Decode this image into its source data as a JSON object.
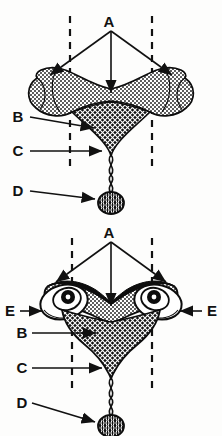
{
  "figure": {
    "background_color": "#fdfdfc",
    "ink_color": "#0d0d0d",
    "panels": [
      {
        "id": "top",
        "name": "upper-diagram",
        "caption": "",
        "labels": [
          {
            "key": "A",
            "text": "A",
            "x": 109,
            "y": 22,
            "arrow_count": 3,
            "position": "top-center"
          },
          {
            "key": "B",
            "text": "B",
            "x": 18,
            "y": 121,
            "arrow_count": 1,
            "position": "left"
          },
          {
            "key": "C",
            "text": "C",
            "x": 18,
            "y": 154,
            "arrow_count": 1,
            "position": "left"
          },
          {
            "key": "D",
            "text": "D",
            "x": 18,
            "y": 190,
            "arrow_count": 1,
            "position": "left"
          }
        ],
        "guides": [
          {
            "name": "left-dashed-guide",
            "x": 70,
            "y1": 16,
            "y2": 170
          },
          {
            "name": "right-dashed-guide",
            "x": 152,
            "y1": 16,
            "y2": 170
          }
        ],
        "parts": [
          {
            "name": "stippled-band",
            "texture": "stipple",
            "fill": "#ffffff"
          },
          {
            "name": "crosshatch-wedge",
            "texture": "crosshatch",
            "fill": "#1a1a1a"
          },
          {
            "name": "twisted-cord",
            "texture": "twist"
          },
          {
            "name": "oval-body",
            "texture": "mottled"
          }
        ]
      },
      {
        "id": "bottom",
        "name": "lower-diagram",
        "caption": "",
        "labels": [
          {
            "key": "A",
            "text": "A",
            "x": 109,
            "y": 232,
            "arrow_count": 3,
            "position": "top-center"
          },
          {
            "key": "E-left",
            "text": "E",
            "x": 10,
            "y": 312,
            "arrow_count": 1,
            "position": "left"
          },
          {
            "key": "E-right",
            "text": "E",
            "x": 206,
            "y": 312,
            "arrow_count": 1,
            "position": "right"
          },
          {
            "key": "B",
            "text": "B",
            "x": 22,
            "y": 334,
            "arrow_count": 1,
            "position": "left"
          },
          {
            "key": "C",
            "text": "C",
            "x": 22,
            "y": 368,
            "arrow_count": 1,
            "position": "left"
          },
          {
            "key": "D",
            "text": "D",
            "x": 22,
            "y": 403,
            "arrow_count": 1,
            "position": "left"
          }
        ],
        "guides": [
          {
            "name": "left-dashed-guide",
            "x": 72,
            "y1": 238,
            "y2": 392
          },
          {
            "name": "right-dashed-guide",
            "x": 152,
            "y1": 238,
            "y2": 392
          }
        ],
        "parts": [
          {
            "name": "stippled-band",
            "texture": "stipple",
            "fill": "#ffffff"
          },
          {
            "name": "crosshatch-wedge",
            "texture": "crosshatch",
            "fill": "#1a1a1a"
          },
          {
            "name": "left-spiral-coil",
            "texture": "spiral"
          },
          {
            "name": "right-spiral-coil",
            "texture": "spiral"
          },
          {
            "name": "twisted-cord",
            "texture": "twist"
          },
          {
            "name": "oval-body",
            "texture": "mottled"
          }
        ]
      }
    ],
    "legend_keys": [
      "A",
      "B",
      "C",
      "D",
      "E"
    ]
  }
}
